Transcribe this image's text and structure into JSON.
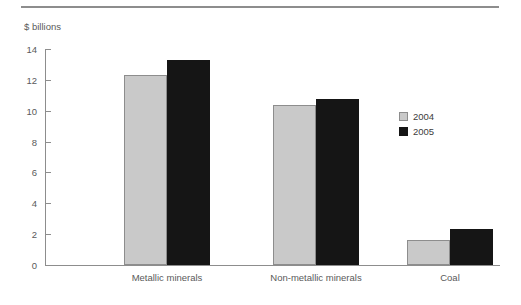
{
  "chart_data": {
    "type": "bar",
    "title": "",
    "subtitle": "",
    "ylabel": "$ billions",
    "xlabel": "",
    "ylim": [
      0,
      14
    ],
    "yticks": [
      0,
      2,
      4,
      6,
      8,
      10,
      12,
      14
    ],
    "ytick_labels": [
      "0",
      "2",
      "4",
      "6",
      "8",
      "10",
      "12",
      "14"
    ],
    "grid": false,
    "legend_position": "right",
    "categories": [
      "Metallic minerals",
      "Non-metallic minerals",
      "Coal"
    ],
    "series": [
      {
        "name": "2004",
        "color": "#c9c9c9",
        "values": [
          12.3,
          10.4,
          1.65
        ]
      },
      {
        "name": "2005",
        "color": "#151515",
        "values": [
          13.3,
          10.75,
          2.35
        ]
      }
    ]
  },
  "legend": {
    "items": [
      {
        "label": "2004"
      },
      {
        "label": "2005"
      }
    ]
  }
}
